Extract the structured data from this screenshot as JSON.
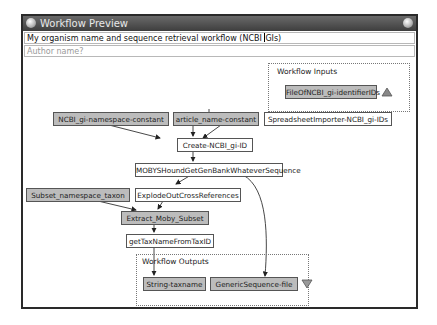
{
  "window": {
    "title": "Workflow Preview",
    "workflow_name_value": "My organism name and sequence retrieval workflow (NCBI GIs)",
    "author_placeholder": "Author name?"
  },
  "groups": {
    "inputs_label": "Workflow Inputs",
    "outputs_label": "Workflow Outputs"
  },
  "nodes": {
    "file_input": "FileOfNCBI_gi-identifierIDs",
    "ncbi_namespace": "NCBI_gi-namespace-constant",
    "article_name": "article_name-constant",
    "spreadsheet": "SpreadsheetImporter-NCBI_gi-IDs",
    "create_id": "Create-NCBI_gi-ID",
    "moby": "MOBYSHoundGetGenBankWhateverSequence",
    "subset_ns": "Subset_namespace_taxon",
    "explode": "ExplodeOutCrossReferences",
    "extract": "Extract_Moby_Subset",
    "gettax": "getTaxNameFromTaxID",
    "out_taxname": "String-taxname",
    "out_seq": "GenericSequence-file"
  },
  "icons": {
    "inputs_toggle": "triangle-up-icon",
    "outputs_toggle": "triangle-down-icon"
  },
  "colors": {
    "processor_fill": "#bcbcbc",
    "node_border": "#555555",
    "titlebar": "#4a4a4a"
  }
}
